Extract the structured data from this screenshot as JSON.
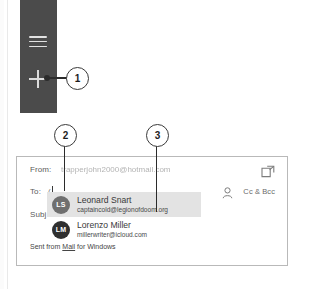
{
  "app_rail": {
    "hamburger_icon": "hamburger-menu-icon",
    "new_mail_icon": "plus-icon",
    "background_color": "#4b4b4b"
  },
  "compose": {
    "from": {
      "label": "From:",
      "value": "trapperjohn2000@hotmail.com"
    },
    "to": {
      "label": "To:",
      "value": "("
    },
    "subject": {
      "label": "Subj"
    },
    "popout_icon": "popout-window-icon",
    "person_icon": "person-icon",
    "cc_bcc_label": "Cc & Bcc",
    "signature_prefix": "Sent from ",
    "signature_link": "Mail",
    "signature_suffix": " for Windows"
  },
  "suggestions": [
    {
      "initials": "LS",
      "name": "Leonard Snart",
      "email": "captaincold@legionofdoom.org",
      "selected": true,
      "avatar_color": "#6f6f6f"
    },
    {
      "initials": "LM",
      "name": "Lorenzo Miller",
      "email": "millerwriter@icloud.com",
      "selected": false,
      "avatar_color": "#2f2f2f"
    }
  ],
  "callouts": [
    {
      "number": "1"
    },
    {
      "number": "2"
    },
    {
      "number": "3"
    }
  ]
}
